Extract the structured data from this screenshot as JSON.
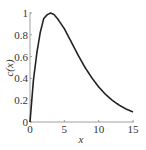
{
  "chart_data": {
    "type": "line",
    "title": "",
    "xlabel": "x",
    "ylabel": "c(x)",
    "xlim": [
      0,
      15
    ],
    "ylim": [
      0,
      1
    ],
    "x_ticks": [
      "0",
      "5",
      "10",
      "15"
    ],
    "y_ticks": [
      "0",
      "0.2",
      "0.4",
      "0.6",
      "0.8",
      "1"
    ],
    "grid": false,
    "legend": null,
    "series": [
      {
        "name": "c(x)",
        "color": "#222222",
        "x": [
          0,
          0.5,
          1,
          1.5,
          2,
          2.5,
          3,
          3.5,
          4,
          5,
          6,
          7,
          8,
          9,
          10,
          11,
          12,
          13,
          14,
          15
        ],
        "y": [
          0,
          0.384,
          0.635,
          0.824,
          0.949,
          0.984,
          1.0,
          0.986,
          0.949,
          0.856,
          0.736,
          0.614,
          0.502,
          0.406,
          0.322,
          0.253,
          0.198,
          0.154,
          0.119,
          0.092
        ]
      }
    ]
  }
}
